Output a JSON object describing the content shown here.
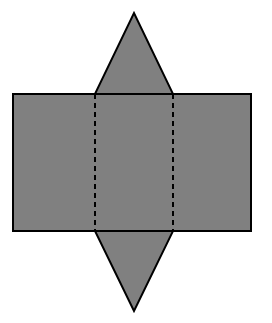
{
  "figure": {
    "canvas": {
      "width": 272,
      "height": 323,
      "background": "#ffffff"
    },
    "style": {
      "fill": "#808080",
      "stroke": "#000000",
      "stroke_width": 2,
      "fold_stroke": "#000000",
      "fold_stroke_width": 2,
      "fold_dash": "5 4"
    },
    "parts": [
      {
        "name": "rectangle-body",
        "shape": "rectangle",
        "points": "13,94 251,94 251,231 13,231",
        "x": 13,
        "y": 94,
        "width": 238,
        "height": 137
      },
      {
        "name": "top-triangle",
        "shape": "triangle",
        "points": "95,94 134,13 173,94",
        "apex_x": 134,
        "apex_y": 13,
        "base_left_x": 95,
        "base_right_x": 173,
        "base_y": 94
      },
      {
        "name": "bottom-triangle",
        "shape": "triangle",
        "points": "95,231 134,311 173,231",
        "apex_x": 134,
        "apex_y": 311,
        "base_left_x": 95,
        "base_right_x": 173,
        "base_y": 231
      }
    ],
    "fold_lines": [
      {
        "name": "fold-line-left",
        "orientation": "vertical",
        "x1": 95,
        "y1": 94,
        "x2": 95,
        "y2": 231
      },
      {
        "name": "fold-line-right",
        "orientation": "vertical",
        "x1": 173,
        "y1": 94,
        "x2": 173,
        "y2": 231
      },
      {
        "name": "fold-line-top",
        "orientation": "horizontal",
        "x1": 95,
        "y1": 94,
        "x2": 173,
        "y2": 94
      },
      {
        "name": "fold-line-bottom",
        "orientation": "horizontal",
        "x1": 95,
        "y1": 231,
        "x2": 173,
        "y2": 231
      }
    ]
  }
}
